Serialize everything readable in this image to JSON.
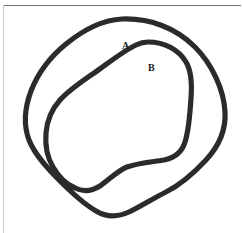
{
  "figure": {
    "kind": "line-diagram",
    "width": 243,
    "height": 233,
    "background_color": "#ffffff",
    "stroke_color": "#2b2b2b",
    "top_rule_color": "#6d6f72",
    "left_rule_color": "#c9cacc",
    "labels": [
      {
        "id": "A",
        "text": "A",
        "refers_to": "outer-closed-curve",
        "x": 126,
        "y": 46
      },
      {
        "id": "B",
        "text": "B",
        "refers_to": "inner-closed-curve",
        "x": 152,
        "y": 68
      }
    ],
    "curves": [
      {
        "id": "outer",
        "name": "outer-closed-curve",
        "label": "A",
        "stroke_width": 5.2,
        "closed": true,
        "path": "M 122 19 C 150 18 176 28 195 47 C 212 64 224 90 225 112 C 226 130 219 146 206 160 C 193 174 178 186 166 192 C 152 199 140 207 129 212 C 118 217 106 217 96 211 C 84 204 72 193 60 181 C 47 168 35 155 29 140 C 23 124 25 107 31 91 C 38 73 50 57 66 44 C 82 31 101 20 122 19 Z"
      },
      {
        "id": "inner",
        "name": "inner-closed-curve",
        "label": "B",
        "stroke_width": 5.2,
        "closed": true,
        "path": "M 148 42 C 165 42 179 50 186 62 C 192 72 192 85 191 98 C 190 113 189 130 185 142 C 182 152 174 158 164 160 C 152 162 138 163 127 167 C 117 171 109 180 100 186 C 92 191 83 192 75 188 C 66 184 58 176 53 167 C 47 157 45 145 46 133 C 47 120 52 109 60 100 C 70 89 84 80 97 71 C 111 61 125 50 136 45 C 140 43 144 42 148 42 Z"
      }
    ]
  }
}
